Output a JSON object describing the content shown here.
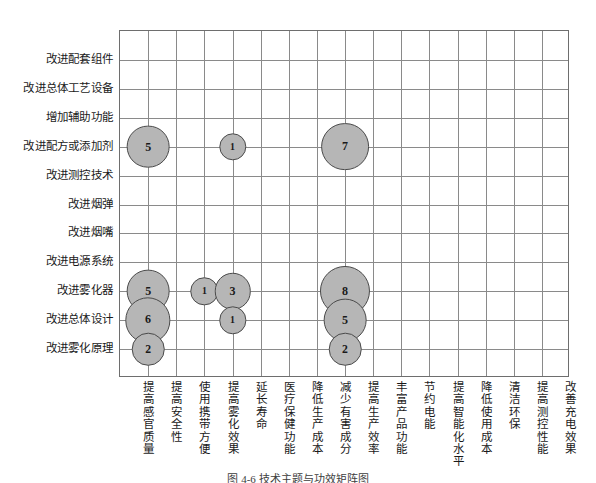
{
  "caption": "图 4-6  技术主题与功效矩阵图",
  "colors": {
    "bubble_fill": "#b6b6b6",
    "bubble_stroke": "#4a4a4a",
    "grid": "#8a8a8a",
    "frame": "#6e6e6e",
    "text": "#1a1a1a",
    "background": "#ffffff"
  },
  "chart_data": {
    "type": "scatter",
    "subtype": "bubble-matrix",
    "title": "",
    "xlabel": "",
    "ylabel": "",
    "grid": true,
    "legend": "none",
    "categories": [
      "提高感官质量",
      "提高安全性",
      "使用携带方便",
      "提高雾化效果",
      "延长寿命",
      "医疗保健功能",
      "降低生产成本",
      "减少有害成分",
      "提高生产效率",
      "丰富产品功能",
      "节约电能",
      "提高智能化水平",
      "降低使用成本",
      "清洁环保",
      "提高测控性能",
      "改善充电效果"
    ],
    "rows": [
      "改进配套组件",
      "改进总体工艺设备",
      "增加辅助功能",
      "改进配方或添加剂",
      "改进测控技术",
      "改进烟弹",
      "改进烟嘴",
      "改进电源系统",
      "改进雾化器",
      "改进总体设计",
      "改进雾化原理"
    ],
    "points": [
      {
        "x": "提高感官质量",
        "y": "改进配方或添加剂",
        "value": 5,
        "label": "5"
      },
      {
        "x": "提高雾化效果",
        "y": "改进配方或添加剂",
        "value": 1,
        "label": "1"
      },
      {
        "x": "减少有害成分",
        "y": "改进配方或添加剂",
        "value": 7,
        "label": "7"
      },
      {
        "x": "提高感官质量",
        "y": "改进雾化器",
        "value": 5,
        "label": "5"
      },
      {
        "x": "使用携带方便",
        "y": "改进雾化器",
        "value": 1,
        "label": "1"
      },
      {
        "x": "提高雾化效果",
        "y": "改进雾化器",
        "value": 3,
        "label": "3"
      },
      {
        "x": "减少有害成分",
        "y": "改进雾化器",
        "value": 8,
        "label": "8"
      },
      {
        "x": "提高感官质量",
        "y": "改进总体设计",
        "value": 6,
        "label": "6"
      },
      {
        "x": "提高雾化效果",
        "y": "改进总体设计",
        "value": 1,
        "label": "1"
      },
      {
        "x": "减少有害成分",
        "y": "改进总体设计",
        "value": 5,
        "label": "5"
      },
      {
        "x": "提高感官质量",
        "y": "改进雾化原理",
        "value": 2,
        "label": "2"
      },
      {
        "x": "减少有害成分",
        "y": "改进雾化原理",
        "value": 2,
        "label": "2"
      }
    ]
  }
}
